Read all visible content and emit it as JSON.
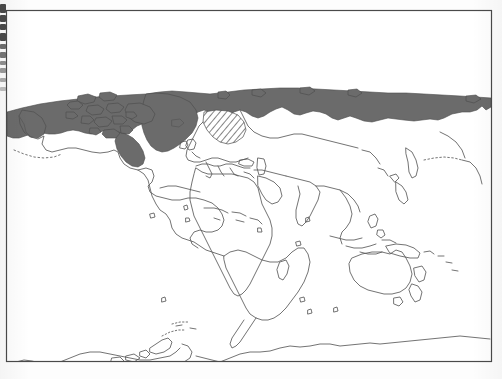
{
  "figure": {
    "kind": "scanned-world-map",
    "projection": "cylindrical",
    "frame": {
      "x": 6,
      "y": 10,
      "width": 486,
      "height": 352
    },
    "background_color": "#fdfdfd",
    "frame_color": "#4a4a4a",
    "coastline_color": "#5a5a5a",
    "shaded_region_color": "#6b6b6b",
    "hatch_region_color": "#555555"
  },
  "legend_semantics": {
    "solid_shading_meaning": "continuous permafrost / arctic extent",
    "hatch_shading_meaning": "discontinuous / sporadic extent"
  },
  "regions": {
    "solid": [
      "Alaska north slope",
      "Canadian Arctic archipelago",
      "Hudson Bay margin",
      "Greenland",
      "Svalbard",
      "Northern Russia",
      "Siberian coast",
      "Chukotka"
    ],
    "hatched": [
      "Scandinavia",
      "Finland",
      "Kola Peninsula"
    ]
  },
  "landmasses": [
    "North America",
    "Greenland",
    "South America",
    "Europe",
    "Africa",
    "Asia",
    "Australia",
    "New Zealand",
    "Antarctica",
    "Japan",
    "Indonesia",
    "Madagascar",
    "Iceland",
    "British Isles",
    "Caribbean islands",
    "Philippines",
    "Papua New Guinea"
  ]
}
